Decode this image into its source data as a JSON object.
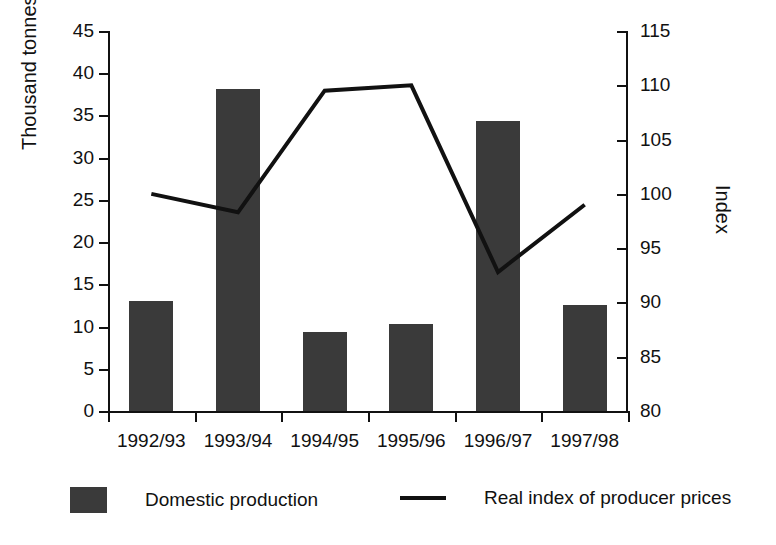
{
  "chart_data": {
    "type": "bar",
    "title": "",
    "subtitle": "",
    "categories": [
      "1992/93",
      "1993/94",
      "1994/95",
      "1995/96",
      "1996/97",
      "1997/98"
    ],
    "series": [
      {
        "name": "Domestic production",
        "type": "bar",
        "axis": "left",
        "unit": "Thousand tonnes",
        "values": [
          13.0,
          38.1,
          9.3,
          10.3,
          34.4,
          12.5
        ]
      },
      {
        "name": "Real index of producer prices",
        "type": "line",
        "axis": "right",
        "unit": "Index",
        "values": [
          100.0,
          98.3,
          109.5,
          110.0,
          92.8,
          99.0
        ]
      }
    ],
    "xlabel": "",
    "ylabel": "Thousand tonnes",
    "y2label": "Index",
    "ylim": [
      0,
      45
    ],
    "y2lim": [
      80,
      115
    ],
    "yticks": [
      0,
      5,
      10,
      15,
      20,
      25,
      30,
      35,
      40,
      45
    ],
    "y2ticks": [
      80,
      85,
      90,
      95,
      100,
      105,
      110,
      115
    ],
    "grid": false,
    "legend_position": "bottom",
    "colors": {
      "bar": "#3a3a3a",
      "line": "#111111",
      "axis": "#111111",
      "background": "#ffffff"
    }
  },
  "axes": {
    "left_title": "Thousand tonnes",
    "right_title": "Index",
    "left_ticks": [
      "45",
      "40",
      "35",
      "30",
      "25",
      "20",
      "15",
      "10",
      "5",
      "0"
    ],
    "right_ticks": [
      "115",
      "110",
      "105",
      "100",
      "95",
      "90",
      "85",
      "80"
    ]
  },
  "categories": [
    "1992/93",
    "1993/94",
    "1994/95",
    "1995/96",
    "1996/97",
    "1997/98"
  ],
  "legend": {
    "bar_label": "Domestic production",
    "line_label": "Real index of producer prices"
  }
}
